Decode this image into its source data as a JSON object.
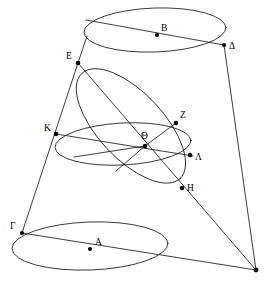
{
  "figure": {
    "width": 270,
    "height": 284,
    "background_color": "#ffffff",
    "stroke_color": "#1a1a1a",
    "point_color": "#000000"
  },
  "labels": {
    "A": "Α",
    "B": "Β",
    "G": "Γ",
    "D": "Δ",
    "E": "Ε",
    "Z": "Ζ",
    "H": "Η",
    "TH": "Θ",
    "K": "Κ",
    "L": "Λ"
  },
  "points": [
    {
      "id": "A",
      "label": "Α",
      "x": 90,
      "y": 249,
      "label_dx": 5,
      "label_dy": -11,
      "dot": true,
      "role": "center-of-lower-circle"
    },
    {
      "id": "B",
      "label": "Β",
      "x": 157,
      "y": 35,
      "label_dx": 4,
      "label_dy": -11,
      "dot": true,
      "role": "center-of-upper-circle"
    },
    {
      "id": "G",
      "label": "Γ",
      "x": 22,
      "y": 233,
      "label_dx": -10,
      "label_dy": -11,
      "dot": true,
      "role": "lower-circle-left"
    },
    {
      "id": "D",
      "label": "Δ",
      "x": 224,
      "y": 45,
      "label_dx": 5,
      "label_dy": -3,
      "dot": true,
      "role": "upper-circle-right"
    },
    {
      "id": "E",
      "label": "Ε",
      "x": 78,
      "y": 63,
      "label_dx": -10,
      "label_dy": -11,
      "dot": true,
      "role": "section-top-vertex"
    },
    {
      "id": "Z",
      "label": "Ζ",
      "x": 176,
      "y": 123,
      "label_dx": 4,
      "label_dy": -12,
      "dot": true,
      "role": "section-right-upper"
    },
    {
      "id": "H",
      "label": "Η",
      "x": 182,
      "y": 188,
      "label_dx": 5,
      "label_dy": -4,
      "dot": true,
      "role": "section-bottom-vertex"
    },
    {
      "id": "TH",
      "label": "Θ",
      "x": 145,
      "y": 146,
      "label_dx": -3,
      "label_dy": -14,
      "dot": true,
      "role": "center-of-middle-circle"
    },
    {
      "id": "K",
      "label": "Κ",
      "x": 56,
      "y": 134,
      "label_dx": -11,
      "label_dy": -10,
      "dot": true,
      "role": "middle-circle-left"
    },
    {
      "id": "L",
      "label": "Λ",
      "x": 190,
      "y": 155,
      "label_dx": 5,
      "label_dy": -2,
      "dot": true,
      "role": "middle-circle-right"
    },
    {
      "id": "APEX",
      "label": "",
      "x": 256,
      "y": 270,
      "label_dx": 0,
      "label_dy": 0,
      "dot": true,
      "role": "cone-apex"
    }
  ],
  "ellipses": [
    {
      "id": "upper-circle",
      "cx": 155,
      "cy": 30,
      "rx": 71,
      "ry": 22,
      "rotation": -2,
      "name": "upper-base-circle"
    },
    {
      "id": "middle-circle",
      "cx": 123,
      "cy": 144,
      "rx": 68,
      "ry": 21,
      "rotation": -3,
      "name": "middle-circle"
    },
    {
      "id": "lower-circle",
      "cx": 90,
      "cy": 246,
      "rx": 78,
      "ry": 24,
      "rotation": -2,
      "name": "lower-base-circle"
    },
    {
      "id": "oblique-section",
      "cx": 131,
      "cy": 126,
      "rx": 72,
      "ry": 33,
      "rotation": 47,
      "name": "oblique-cutting-plane-ellipse"
    }
  ],
  "lines": [
    {
      "id": "chord-upper",
      "from": "E",
      "to": "D",
      "name": "chord-E-to-Delta"
    },
    {
      "id": "chord-lower",
      "from": "G",
      "to": "APEX",
      "name": "chord-Gamma-to-apex"
    },
    {
      "id": "ruling-left",
      "from": "E",
      "to": "G",
      "name": "cone-ruling-left"
    },
    {
      "id": "ruling-right",
      "from": "D",
      "to": "APEX",
      "name": "cone-ruling-right"
    },
    {
      "id": "axis-section",
      "from": "E",
      "to": "APEX",
      "name": "section-diameter-E-H-apex"
    },
    {
      "id": "diam-middle",
      "from": "K",
      "to": "L",
      "name": "middle-circle-diameter-K-Lambda"
    },
    {
      "id": "chord-ZTH",
      "from": "Z",
      "to": "TH",
      "name": "chord-Z-Theta"
    },
    {
      "id": "chord-THdown",
      "from": "TH",
      "to": "MIDLOW",
      "name": "chord-Theta-to-lower-arc"
    }
  ],
  "aux_points": [
    {
      "id": "MIDLOW",
      "x": 116,
      "y": 171,
      "name": "middle-circle-front-point"
    }
  ]
}
